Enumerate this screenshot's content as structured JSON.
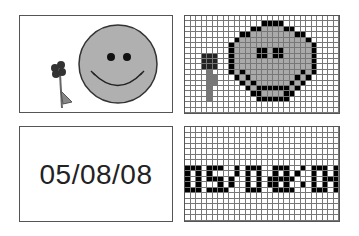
{
  "panels": {
    "smiley_vector": {
      "label": "smiley face with flower (vector)"
    },
    "smiley_bitmap": {
      "label": "smiley face with flower (bitmap grid)",
      "cols": 28,
      "rows": 18
    },
    "date_vector": {
      "text": "05/08/08"
    },
    "date_bitmap": {
      "label": "05/08/08 (bitmap grid)",
      "cols": 28,
      "rows": 17
    }
  },
  "colors": {
    "face_fill": "#aaaaaa",
    "outline": "#000000",
    "flower": "#333333",
    "stem": "#777777",
    "border": "#555555"
  },
  "smiley_rows": [
    "0000000000000000000000000000",
    "0000000000000011110000000000",
    "0000000000001122221100000000",
    "0000000000112222222211000000",
    "0000000001222222222222100000",
    "0000000012222222222222210000",
    "0000000012222112112222210000",
    "0003330012222112112222210000",
    "0003330012222222222222210000",
    "0003330012222222222222210000",
    "0000400012122222222221210000",
    "0000440001212222222212100000",
    "0000440000121222222121000000",
    "0000400000012111111210000000",
    "0000400000001122221100000000",
    "0000400000000111111000000000",
    "0000000000000000000000000000",
    "0000000000000000000000000000"
  ],
  "date_rows": [
    "0000000000000000000000000000",
    "0000000000000000000000000000",
    "0000000000000000000000000000",
    "0000000000000000000000000000",
    "0000000000000000000000000000",
    "0000000000000000000000000000",
    "0000000000000000000000000000",
    "1110111001011100111001011101",
    "1010100001010100101010010101",
    "1010111010010101111100010111",
    "1010001010010101101001010101",
    "1110111100011100111100011101",
    "0000000000000000000000000000",
    "0000000000000000000000000000",
    "0000000000000000000000000000",
    "0000000000000000000000000000",
    "0000000000000000000000000000"
  ]
}
